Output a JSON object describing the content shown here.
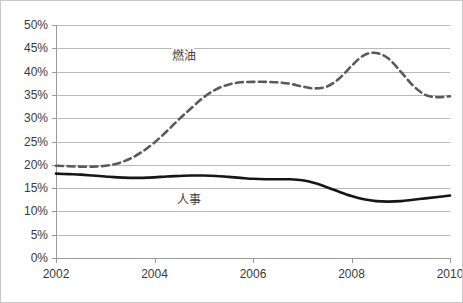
{
  "chart_data": {
    "type": "line",
    "title": "",
    "subtitle": "",
    "xlabel": "",
    "ylabel": "",
    "xlim": [
      2002,
      2010
    ],
    "ylim": [
      0,
      0.5
    ],
    "y_tick_labels": [
      "50%",
      "45%",
      "40%",
      "35%",
      "30%",
      "25%",
      "20%",
      "15%",
      "10%",
      "5%",
      "0%"
    ],
    "y_tick_values": [
      0.5,
      0.45,
      0.4,
      0.35,
      0.3,
      0.25,
      0.2,
      0.15,
      0.1,
      0.05,
      0.0
    ],
    "x_tick_labels": [
      "2002",
      "2004",
      "2006",
      "2008",
      "2010"
    ],
    "x_tick_values": [
      2002,
      2004,
      2006,
      2008,
      2010
    ],
    "grid": true,
    "legend": "none",
    "annotations": [
      {
        "label": "燃油",
        "x": 2004.6,
        "y": 0.425,
        "series": "fuel"
      },
      {
        "label": "人事",
        "x": 2004.7,
        "y": 0.115,
        "series": "personnel"
      }
    ],
    "x": [
      2002.0,
      2002.25,
      2002.5,
      2002.75,
      2003.0,
      2003.25,
      2003.5,
      2003.75,
      2004.0,
      2004.25,
      2004.5,
      2004.75,
      2005.0,
      2005.25,
      2005.5,
      2005.75,
      2006.0,
      2006.25,
      2006.5,
      2006.75,
      2007.0,
      2007.25,
      2007.5,
      2007.75,
      2008.0,
      2008.25,
      2008.5,
      2008.75,
      2009.0,
      2009.25,
      2009.5,
      2009.75,
      2010.0
    ],
    "series": [
      {
        "name": "燃油",
        "key": "fuel",
        "style": "dashed",
        "color": "#5a5a5a",
        "values": [
          0.198,
          0.197,
          0.196,
          0.196,
          0.198,
          0.203,
          0.213,
          0.228,
          0.248,
          0.272,
          0.298,
          0.322,
          0.345,
          0.362,
          0.372,
          0.377,
          0.378,
          0.378,
          0.377,
          0.374,
          0.368,
          0.364,
          0.368,
          0.385,
          0.412,
          0.435,
          0.44,
          0.428,
          0.4,
          0.37,
          0.35,
          0.345,
          0.347
        ]
      },
      {
        "name": "人事",
        "key": "personnel",
        "style": "solid",
        "color": "#161616",
        "values": [
          0.181,
          0.18,
          0.179,
          0.177,
          0.175,
          0.173,
          0.172,
          0.172,
          0.173,
          0.175,
          0.176,
          0.177,
          0.177,
          0.176,
          0.174,
          0.172,
          0.17,
          0.169,
          0.169,
          0.169,
          0.167,
          0.161,
          0.152,
          0.142,
          0.133,
          0.126,
          0.122,
          0.121,
          0.122,
          0.125,
          0.128,
          0.131,
          0.134
        ]
      }
    ]
  },
  "plot": {
    "left": 56,
    "right": 450,
    "top": 25,
    "bottom": 258
  }
}
